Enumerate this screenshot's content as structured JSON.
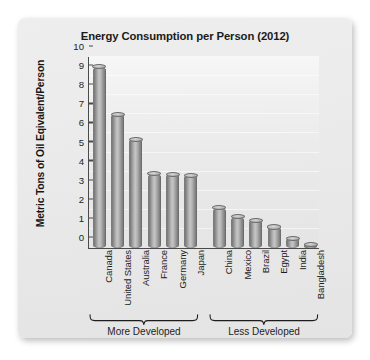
{
  "card": {
    "background_color": "#eaeaea",
    "plot_background_color": "#e9e9e9"
  },
  "chart_data": {
    "type": "bar",
    "title": "Energy Consumption per Person (2012)",
    "xlabel": "",
    "ylabel": "Metric Tons of Oil Eqivalent/Person",
    "ylim": [
      0,
      10
    ],
    "yticks": [
      10,
      9,
      8,
      7,
      6,
      5,
      4,
      3,
      2,
      1,
      0
    ],
    "grid": false,
    "legend": "none",
    "bar_style": "cylinder",
    "bar_color": "#aaaaaa",
    "categories": [
      "Canada",
      "United States",
      "Australia",
      "France",
      "Germany",
      "Japan",
      "China",
      "Mexico",
      "Brazil",
      "Egypt",
      "India",
      "Bangladesh"
    ],
    "values": [
      9.5,
      7.0,
      5.7,
      3.9,
      3.85,
      3.8,
      2.1,
      1.65,
      1.45,
      1.1,
      0.5,
      0.2
    ],
    "groups": [
      {
        "label": "More Developed",
        "start_index": 0,
        "end_index": 5
      },
      {
        "label": "Less Developed",
        "start_index": 6,
        "end_index": 11
      }
    ]
  }
}
